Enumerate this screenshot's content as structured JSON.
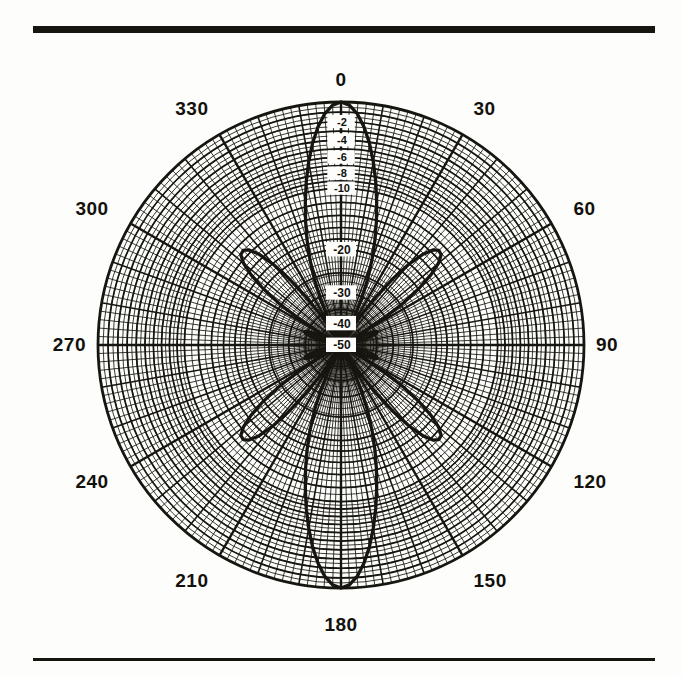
{
  "figure": {
    "kind": "polar-antenna-radiation-pattern",
    "top_rule": "",
    "bottom_rule": ""
  },
  "chart_data": {
    "type": "line",
    "subtype": "polar",
    "title": "",
    "xlabel": "",
    "ylabel": "",
    "grid": true,
    "legend": false,
    "angle_unit": "degrees",
    "radial_unit": "dB",
    "rlim": [
      -50,
      0
    ],
    "rscale": "logarithmic-dB",
    "angle_tick_labels": [
      "0",
      "30",
      "60",
      "90",
      "120",
      "150",
      "180",
      "210",
      "240",
      "270",
      "300",
      "330"
    ],
    "angle_ticks": [
      0,
      30,
      60,
      90,
      120,
      150,
      180,
      210,
      240,
      270,
      300,
      330
    ],
    "angle_minor_step": 2,
    "angle_major_step": 10,
    "radial_tick_labels": [
      "-2",
      "-4",
      "-6",
      "-8",
      "-10",
      "-20",
      "-30",
      "-40",
      "-50"
    ],
    "radial_ticks": [
      -2,
      -4,
      -6,
      -8,
      -10,
      -20,
      -30,
      -40,
      -50
    ],
    "radial_ring_values": [
      -1,
      -2,
      -3,
      -4,
      -5,
      -6,
      -7,
      -8,
      -9,
      -10,
      -12,
      -14,
      -16,
      -18,
      -20,
      -25,
      -30,
      -35,
      -40,
      -45,
      -50
    ],
    "series": [
      {
        "name": "pattern",
        "angles": [
          0,
          2,
          4,
          6,
          8,
          10,
          12,
          14,
          16,
          18,
          20,
          22,
          24,
          26,
          28,
          30,
          32,
          34,
          36,
          38,
          40,
          42,
          44,
          46,
          48,
          50,
          52,
          54,
          56,
          58,
          60,
          62,
          64,
          66,
          68,
          70,
          72,
          74,
          76,
          78,
          80,
          82,
          84,
          86,
          88,
          90
        ],
        "values_dB": [
          0,
          -0.3,
          -1.1,
          -2.4,
          -4.1,
          -6.2,
          -8.6,
          -11.3,
          -14.2,
          -17.4,
          -21.0,
          -25.2,
          -30.5,
          -37.5,
          -46.0,
          -50.0,
          -44.0,
          -35.0,
          -28.0,
          -22.5,
          -18.2,
          -15.3,
          -13.6,
          -13.0,
          -13.2,
          -14.4,
          -16.6,
          -19.8,
          -24.2,
          -30.5,
          -39.5,
          -50.0,
          -44.0,
          -38.0,
          -35.0,
          -34.0,
          -34.5,
          -36.5,
          -39.5,
          -43.5,
          -48.0,
          -50.0,
          -50.0,
          -50.0,
          -50.0,
          -50.0
        ],
        "symmetry": "mirrored about 0-180 axis and about 90-270 axis",
        "main_lobe_peaks_deg": [
          0,
          180
        ],
        "main_lobe_peak_dB": 0,
        "side_lobe_peaks_deg": [
          46,
          134,
          226,
          314
        ],
        "side_lobe_peak_dB": -13
      }
    ]
  }
}
